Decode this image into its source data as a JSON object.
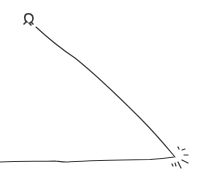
{
  "diagram": {
    "stroke_color": "#3a3a3a",
    "background": "#ffffff",
    "elements": [
      {
        "name": "stick-head",
        "shape": "rounded blob",
        "approx_center": [
          28,
          17
        ]
      },
      {
        "name": "diagonal-stick",
        "from": [
          34,
          25
        ],
        "to": [
          175,
          157
        ]
      },
      {
        "name": "ground-line",
        "from": [
          0,
          161
        ],
        "to": [
          174,
          157
        ]
      },
      {
        "name": "impact-sparks",
        "approx_center": [
          180,
          160
        ],
        "count": 7
      }
    ]
  }
}
